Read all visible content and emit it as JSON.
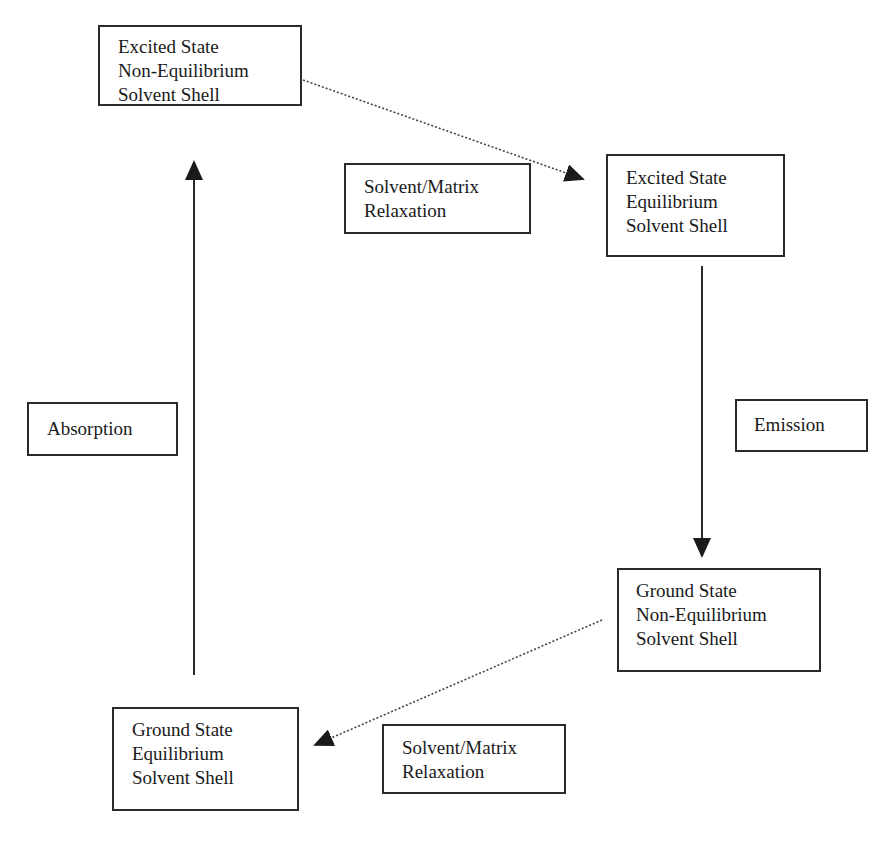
{
  "diagram": {
    "nodes": {
      "excited_noneq": {
        "lines": [
          "Excited State",
          "Non-Equilibrium",
          "Solvent Shell"
        ]
      },
      "excited_eq": {
        "lines": [
          "Excited State",
          "Equilibrium",
          "Solvent Shell"
        ]
      },
      "ground_noneq": {
        "lines": [
          "Ground State",
          "Non-Equilibrium",
          "Solvent Shell"
        ]
      },
      "ground_eq": {
        "lines": [
          "Ground State",
          "Equilibrium",
          "Solvent Shell"
        ]
      }
    },
    "labels": {
      "relaxation_top": {
        "lines": [
          "Solvent/Matrix",
          "Relaxation"
        ]
      },
      "absorption": {
        "lines": [
          "Absorption"
        ]
      },
      "emission": {
        "lines": [
          "Emission"
        ]
      },
      "relaxation_bottom": {
        "lines": [
          "Solvent/Matrix",
          "Relaxation"
        ]
      }
    },
    "edges": [
      {
        "from": "ground_eq",
        "to": "excited_noneq",
        "label": "Absorption",
        "style": "solid"
      },
      {
        "from": "excited_noneq",
        "to": "excited_eq",
        "label": "Solvent/Matrix Relaxation",
        "style": "dotted"
      },
      {
        "from": "excited_eq",
        "to": "ground_noneq",
        "label": "Emission",
        "style": "solid"
      },
      {
        "from": "ground_noneq",
        "to": "ground_eq",
        "label": "Solvent/Matrix Relaxation",
        "style": "dotted"
      }
    ],
    "colors": {
      "line": "#2a2a2a",
      "background": "#ffffff"
    }
  }
}
